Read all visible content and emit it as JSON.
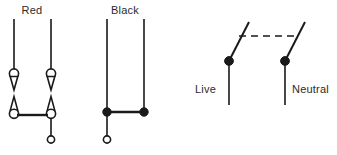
{
  "diagram": {
    "background_color": "#ffffff",
    "line_color": "#1a1a1a",
    "text_color": "#2b2b2b",
    "width": 337,
    "height": 155,
    "groups": [
      {
        "id": "red-group",
        "label": "Red",
        "label_x": 32,
        "label_y": 14,
        "rails": [
          {
            "id": "red-rail-left",
            "x": 14,
            "y_top": 19,
            "y_bottom": 69
          },
          {
            "id": "red-rail-right",
            "x": 51,
            "y_top": 19,
            "y_bottom": 69
          }
        ],
        "symbols": [
          {
            "id": "red-symbol-left",
            "x": 14,
            "y_top": 69,
            "y_bottom": 115,
            "type": "double-triangle-circle"
          },
          {
            "id": "red-symbol-right",
            "x": 51,
            "y_top": 69,
            "y_bottom": 115,
            "type": "double-triangle-circle"
          }
        ],
        "crossbar": {
          "id": "red-crossbar",
          "x1": 14,
          "x2": 51,
          "y": 115
        },
        "tap": {
          "id": "red-tap",
          "x": 51,
          "y_top": 115,
          "y_bottom": 137,
          "terminal_y": 140,
          "terminal_type": "open-circle"
        }
      },
      {
        "id": "black-group",
        "label": "Black",
        "label_x": 125,
        "label_y": 14,
        "rails": [
          {
            "id": "black-rail-left",
            "x": 107,
            "y_top": 19,
            "y_bottom": 112
          },
          {
            "id": "black-rail-right",
            "x": 144,
            "y_top": 19,
            "y_bottom": 112
          }
        ],
        "junctions": [
          {
            "id": "black-junction-left",
            "x": 107,
            "y": 112,
            "type": "filled-dot"
          },
          {
            "id": "black-junction-right",
            "x": 144,
            "y": 112,
            "type": "filled-dot"
          }
        ],
        "crossbar": {
          "id": "black-crossbar",
          "x1": 107,
          "x2": 144,
          "y": 112
        },
        "tap": {
          "id": "black-tap",
          "x": 107,
          "y_top": 112,
          "y_bottom": 137,
          "terminal_y": 140,
          "terminal_type": "open-circle"
        }
      },
      {
        "id": "switch-group",
        "label": "",
        "poles": [
          {
            "id": "pole-live",
            "label": "Live",
            "label_x": 216,
            "label_y": 93,
            "label_anchor": "end",
            "pivot_x": 229,
            "pivot_y": 61,
            "blade_tip_x": 249,
            "blade_tip_y": 22,
            "lead_y_bottom": 105
          },
          {
            "id": "pole-neutral",
            "label": "Neutral",
            "label_x": 292,
            "label_y": 93,
            "label_anchor": "start",
            "pivot_x": 285,
            "pivot_y": 61,
            "blade_tip_x": 305,
            "blade_tip_y": 22,
            "lead_y_bottom": 105
          }
        ],
        "gang_link": {
          "id": "gang-link",
          "x1": 239,
          "x2": 295,
          "y": 36,
          "style": "dashed"
        }
      }
    ]
  }
}
